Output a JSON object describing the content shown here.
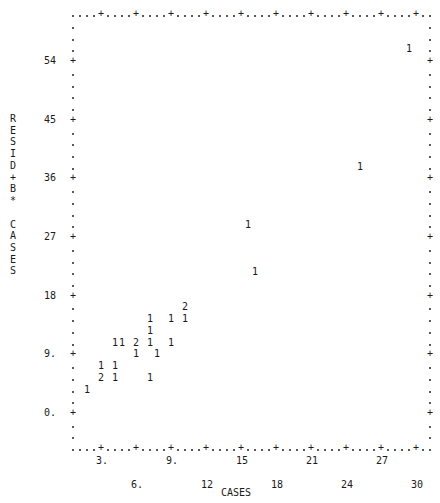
{
  "chart_data": {
    "type": "scatter",
    "style": "line-printer character plot (digits = number of cases at position)",
    "title": "",
    "xlabel": "CASES",
    "ylabel": "RESID+B* CASES",
    "xlim": [
      0.6,
      30.6
    ],
    "ylim": [
      -5.4,
      61.2
    ],
    "x_ticks": [
      3,
      6,
      9,
      12,
      15,
      18,
      21,
      24,
      27,
      30
    ],
    "x_tick_labels": [
      "3.",
      "6.",
      "9.",
      "12",
      "15",
      "18",
      "21",
      "24",
      "27",
      "30"
    ],
    "y_ticks": [
      0,
      9,
      18,
      27,
      36,
      45,
      54
    ],
    "y_tick_labels": [
      "0.",
      "9.",
      "18",
      "27",
      "36",
      "45",
      "54"
    ],
    "grid": false,
    "legend": null,
    "points": [
      {
        "x": 1.8,
        "y": 3.6,
        "count": 1
      },
      {
        "x": 3.0,
        "y": 5.4,
        "count": 2
      },
      {
        "x": 4.2,
        "y": 5.4,
        "count": 1
      },
      {
        "x": 7.2,
        "y": 5.4,
        "count": 1
      },
      {
        "x": 3.0,
        "y": 7.2,
        "count": 1
      },
      {
        "x": 4.2,
        "y": 7.2,
        "count": 1
      },
      {
        "x": 6.0,
        "y": 9.0,
        "count": 1
      },
      {
        "x": 7.8,
        "y": 9.0,
        "count": 1
      },
      {
        "x": 4.2,
        "y": 10.8,
        "count": 1
      },
      {
        "x": 4.8,
        "y": 10.8,
        "count": 1
      },
      {
        "x": 6.0,
        "y": 10.8,
        "count": 2
      },
      {
        "x": 7.2,
        "y": 10.8,
        "count": 1
      },
      {
        "x": 9.0,
        "y": 10.8,
        "count": 1
      },
      {
        "x": 7.2,
        "y": 12.6,
        "count": 1
      },
      {
        "x": 7.2,
        "y": 14.4,
        "count": 1
      },
      {
        "x": 9.0,
        "y": 14.4,
        "count": 1
      },
      {
        "x": 10.2,
        "y": 14.4,
        "count": 1
      },
      {
        "x": 10.2,
        "y": 16.2,
        "count": 2
      },
      {
        "x": 16.2,
        "y": 21.6,
        "count": 1
      },
      {
        "x": 15.6,
        "y": 28.8,
        "count": 1
      },
      {
        "x": 25.2,
        "y": 37.8,
        "count": 1
      },
      {
        "x": 29.4,
        "y": 55.8,
        "count": 1
      }
    ]
  },
  "axes": {
    "x_title": "CASES",
    "y_title_chars": [
      "R",
      "E",
      "S",
      "I",
      "D",
      "+",
      "B",
      "*",
      " ",
      "C",
      "A",
      "S",
      "E",
      "S"
    ]
  },
  "colors": {
    "ink": "#1a1a1a",
    "background": "#ffffff"
  }
}
